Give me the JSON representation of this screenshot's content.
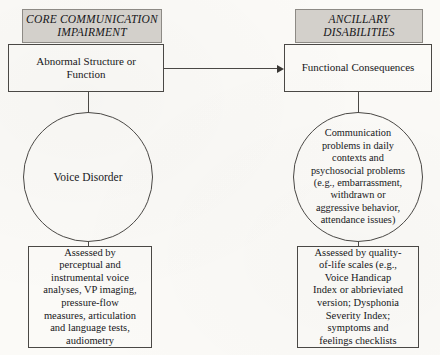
{
  "diagram": {
    "accent_gray": "#d3d0cb",
    "line_color": "#4a4845",
    "columns": [
      {
        "id": "core",
        "header": "CORE COMMUNICATION\nIMPAIRMENT",
        "box": "Abnormal Structure or\nFunction",
        "circle": "Voice Disorder",
        "assessment": "Assessed by\nperceptual and\ninstrumental voice\nanalyses, VP imaging,\npressure-flow\nmeasures, articulation\nand language tests,\naudiometry"
      },
      {
        "id": "ancillary",
        "header": "ANCILLARY\nDISABILITIES",
        "box": "Functional Consequences",
        "circle": "Communication\nproblems in daily\ncontexts and\npsychosocial problems\n(e.g., embarrassment,\nwithdrawn or\naggressive behavior,\nattendance issues)",
        "assessment": "Assessed by quality-\nof-life scales (e.g.,\nVoice Handicap\nIndex or abbrieviated\nversion; Dysphonia\nSeverity Index;\nsymptoms and\nfeelings checklists"
      }
    ],
    "connector": {
      "name": "arrow-core-to-ancillary",
      "direction": "left-to-right"
    }
  }
}
